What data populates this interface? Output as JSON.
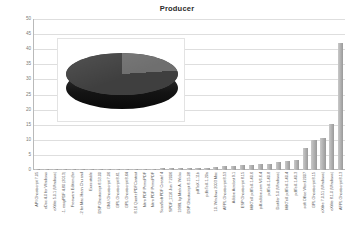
{
  "chart": {
    "title": "Producer"
  },
  "chart_data": {
    "type": "bar",
    "title": "Producer",
    "xlabel": "",
    "ylabel": "",
    "ylim": [
      0,
      50
    ],
    "yticks": [
      50,
      45,
      40,
      35,
      30,
      25,
      20,
      15,
      10,
      5,
      0
    ],
    "grid": true,
    "legend": "none",
    "bar_color": "#a8a8a8",
    "categories": [
      "API Ghostscript 7.05",
      "eDoc 4.0 for Windows",
      "eXtlite 5.0.1 (Windows)",
      "-1. easyPDF 4.80 (2013)",
      "Freeware Edition (for",
      "-2 for Mac-Haan Chu and",
      "Executable",
      "DSP Ghostscript 8.53.00",
      "GNU Ghostscript 7.06",
      "GPL Ghostscript 8.61",
      "GPL Ghostscript 8.64",
      "8.16 Quartz PDFContext",
      "Nitro PDF PrimoPDF",
      "Nitro PDF PrimoPDF",
      "ScanSoft PDF Create! 4",
      "SPDF_1116 Jun 7 2006",
      "1998L by Mark A. Wicks",
      "DSP Ghostscript 8.15.08",
      "pdfTeX-1.11b",
      "pdfeTeX-1.20a",
      "10. Windows 2003 Mac",
      "AFPL Ghostscript 8.53",
      "Adobe Acrobat 9.1",
      "ESP Ghostscript 8.15",
      "MiKTeX pdfTeX-1.40.6",
      "pdf.adobe.com V6.6.4",
      "pdfTeX-1.40.8",
      "Distiller 5.0 (Windows)",
      "MiKTeX pdfTeX-1.40.4",
      "pdfTeX-1.40.3",
      "soft Office Word 2007",
      "GPL Ghostscript 8.15",
      "eXtlite 7.0.51 (Windows)",
      "eXtlite 8.1.0 (Windows)",
      "AFPL Ghostscript 8.13"
    ],
    "values": [
      0.4,
      0.4,
      0.4,
      0.4,
      0.4,
      0.4,
      0.4,
      0.5,
      0.5,
      0.5,
      0.5,
      0.5,
      0.5,
      0.5,
      0.6,
      0.6,
      0.6,
      0.6,
      0.7,
      0.7,
      1.1,
      1.3,
      1.4,
      1.6,
      1.8,
      1.9,
      2.1,
      2.6,
      3.0,
      3.4,
      7.4,
      9.8,
      10.6,
      15.4,
      42.2
    ]
  },
  "pie_inset": {
    "type": "pie",
    "title": "",
    "labels": [
      "major-share",
      "minor-share"
    ],
    "values": [
      76,
      24
    ],
    "colors": [
      "#3f3f3f",
      "#6f6f6f"
    ],
    "style": "3d"
  }
}
